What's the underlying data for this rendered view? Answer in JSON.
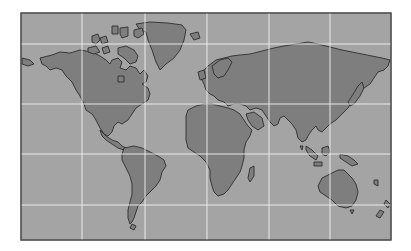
{
  "map": {
    "title": "",
    "projection": "world-cylindrical",
    "colors": {
      "background": "#ffffff",
      "ocean": "#a4a4a4",
      "land": "#7e7e7e",
      "coastline": "#2e2e2e",
      "graticule": "#f2f2f2",
      "frame": "#555555"
    },
    "frame": {
      "x": 21,
      "y": 13,
      "width": 370,
      "height": 227
    },
    "graticule": {
      "meridians_x": [
        82,
        145,
        207,
        269,
        330
      ],
      "parallels_y": [
        44,
        104,
        154,
        205
      ]
    },
    "landmasses": [
      {
        "name": "north-america",
        "d": "M40 58 L52 55 L60 52 L70 53 L80 50 L92 52 L100 56 L106 60 L110 64 L112 60 L118 58 L122 62 L120 68 L126 70 L130 66 L136 68 L140 74 L144 70 L148 76 L146 82 L142 84 L148 88 L150 94 L148 100 L142 104 L136 108 L132 114 L128 120 L122 124 L118 122 L114 126 L112 132 L108 136 L104 134 L100 128 L96 120 L92 114 L86 110 L84 104 L80 96 L76 90 L72 82 L66 76 L62 70 L56 68 L50 70 L46 66 L42 64 Z"
      },
      {
        "name": "central-america",
        "d": "M100 130 L106 136 L112 140 L118 142 L122 146 L126 148 L124 150 L118 148 L112 144 L106 140 L102 136 Z"
      },
      {
        "name": "alaska-west-tip",
        "d": "M22 58 L30 60 L34 64 L28 66 L22 64 Z"
      },
      {
        "name": "greenland",
        "d": "M136 24 L150 22 L168 23 L182 25 L186 30 L184 40 L180 50 L174 58 L166 64 L160 70 L156 62 L152 50 L148 40 L146 32 L140 30 Z"
      },
      {
        "name": "arctic-island-1",
        "d": "M92 36 L98 34 L100 40 L96 44 L92 42 Z"
      },
      {
        "name": "arctic-island-2",
        "d": "M100 38 L106 36 L108 42 L102 44 Z"
      },
      {
        "name": "arctic-island-3",
        "d": "M112 26 L118 26 L118 34 L112 34 Z"
      },
      {
        "name": "arctic-island-4",
        "d": "M120 28 L128 27 L128 36 L122 38 L120 34 Z"
      },
      {
        "name": "arctic-island-5",
        "d": "M134 30 L142 28 L144 34 L138 38 L134 36 Z"
      },
      {
        "name": "baffin-island",
        "d": "M118 48 L126 46 L134 50 L138 56 L136 62 L130 64 L124 58 L118 54 Z"
      },
      {
        "name": "arctic-island-6",
        "d": "M88 48 L96 46 L100 52 L94 54 L88 52 Z"
      },
      {
        "name": "arctic-island-7",
        "d": "M102 48 L108 46 L110 52 L104 54 Z"
      },
      {
        "name": "hudson-bay-island",
        "d": "M118 76 L124 76 L124 82 L118 82 Z"
      },
      {
        "name": "south-america",
        "d": "M124 148 L134 146 L142 148 L150 152 L158 156 L164 160 L166 166 L162 172 L160 180 L156 186 L150 192 L146 196 L142 202 L138 206 L136 212 L134 218 L132 222 L130 224 L128 218 L128 210 L130 202 L132 194 L132 184 L130 176 L126 168 L122 160 L122 154 Z"
      },
      {
        "name": "tierra-del-fuego",
        "d": "M132 224 L136 226 L134 230 L130 228 Z"
      },
      {
        "name": "iceland",
        "d": "M190 34 L198 32 L200 38 L194 40 Z"
      },
      {
        "name": "eurasia",
        "d": "M200 74 L208 66 L216 60 L224 58 L232 56 L240 55 L250 54 L258 52 L266 50 L274 48 L284 46 L296 44 L308 42 L318 44 L326 46 L334 48 L342 50 L352 52 L362 54 L372 56 L382 58 L390 60 L388 66 L384 70 L378 72 L374 78 L370 84 L364 88 L360 92 L356 96 L352 102 L348 108 L344 112 L340 116 L336 120 L330 124 L326 128 L322 132 L318 130 L316 126 L312 130 L308 136 L306 140 L302 142 L298 138 L296 130 L292 124 L288 120 L284 116 L280 118 L278 124 L274 126 L270 122 L266 116 L262 110 L256 108 L250 110 L246 106 L240 104 L234 104 L228 106 L224 102 L218 100 L214 96 L210 94 L206 90 L204 84 L202 80 Z"
      },
      {
        "name": "scandinavia",
        "d": "M212 66 L220 60 L228 58 L232 62 L228 70 L224 76 L218 78 L214 74 Z"
      },
      {
        "name": "british-isles",
        "d": "M198 72 L204 70 L206 78 L200 80 Z"
      },
      {
        "name": "africa",
        "d": "M188 110 L196 106 L204 104 L212 104 L220 106 L228 108 L234 110 L240 114 L244 120 L248 126 L252 130 L250 136 L246 142 L244 150 L244 158 L242 166 L240 172 L236 178 L232 184 L228 190 L224 194 L218 196 L214 192 L212 186 L210 178 L210 170 L206 162 L200 156 L194 152 L188 148 L186 140 L186 132 L186 124 L186 116 Z"
      },
      {
        "name": "madagascar",
        "d": "M250 168 L254 166 L254 176 L250 182 L248 178 Z"
      },
      {
        "name": "arabia",
        "d": "M246 114 L254 112 L262 118 L264 126 L258 130 L252 126 L248 120 Z"
      },
      {
        "name": "japan",
        "d": "M358 86 L362 82 L364 88 L360 96 L354 104 L350 106 L348 102 L352 96 Z"
      },
      {
        "name": "sri-lanka",
        "d": "M300 146 L303 146 L302 150 Z"
      },
      {
        "name": "sumatra",
        "d": "M306 146 L312 150 L318 156 L316 160 L310 156 L306 150 Z"
      },
      {
        "name": "borneo",
        "d": "M322 148 L328 146 L330 152 L326 156 L322 154 Z"
      },
      {
        "name": "java",
        "d": "M314 162 L322 162 L322 166 L314 166 Z"
      },
      {
        "name": "new-guinea",
        "d": "M340 154 L348 156 L354 160 L358 164 L352 166 L346 162 L340 158 Z"
      },
      {
        "name": "australia",
        "d": "M322 178 L330 174 L338 170 L344 170 L348 174 L352 178 L356 184 L358 192 L356 200 L352 206 L346 208 L338 206 L332 200 L326 196 L320 192 L318 186 Z"
      },
      {
        "name": "tasmania",
        "d": "M350 210 L354 210 L352 214 Z"
      },
      {
        "name": "new-zealand-north",
        "d": "M386 200 L390 204 L388 208 L384 204 Z"
      },
      {
        "name": "new-zealand-south",
        "d": "M380 210 L384 212 L380 218 L376 216 Z"
      },
      {
        "name": "pacific-island",
        "d": "M374 180 L378 180 L378 186 L374 184 Z"
      }
    ]
  }
}
